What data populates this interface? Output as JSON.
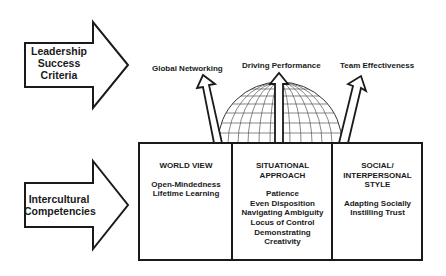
{
  "diagram": {
    "left_arrows": [
      {
        "label_lines": [
          "Leadership",
          "Success",
          "Criteria"
        ]
      },
      {
        "label_lines": [
          "Intercultural",
          "Competencies"
        ]
      }
    ],
    "criteria": [
      {
        "label": "Global Networking"
      },
      {
        "label": "Driving Performance"
      },
      {
        "label": "Team Effectiveness"
      }
    ],
    "competency_boxes": [
      {
        "title_lines": [
          "WORLD VIEW"
        ],
        "items": [
          "Open-Mindedness",
          "Lifetime Learning"
        ]
      },
      {
        "title_lines": [
          "SITUATIONAL",
          "APPROACH"
        ],
        "items": [
          "Patience",
          "Even Disposition",
          "Navigating Ambiguity",
          "Locus of Control",
          "Demonstrating",
          "Creativity"
        ]
      },
      {
        "title_lines": [
          "SOCIAL/",
          "INTERPERSONAL",
          "STYLE"
        ],
        "items": [
          "Adapting Socially",
          "Instilling Trust"
        ]
      }
    ],
    "center_graphic": "globe-icon",
    "colors": {
      "stroke": "#1a1a1a",
      "fill": "#ffffff",
      "grid": "#555555"
    }
  }
}
